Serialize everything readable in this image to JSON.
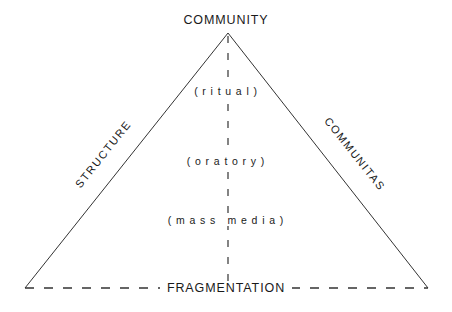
{
  "figure": {
    "type": "triangle-continuum-diagram",
    "background_color": "#ffffff",
    "line_color": "#333333"
  },
  "vertices": {
    "apex": "COMMUNITY",
    "base": "FRAGMENTATION"
  },
  "sides": {
    "left": "STRUCTURE",
    "right": "COMMUNITAS"
  },
  "axis": {
    "labels": [
      "( r i t u a l )",
      "( o r a t o r y )",
      "( m a s s   m e d i a )"
    ],
    "plain_labels": [
      "(ritual)",
      "(oratory)",
      "(mass media)"
    ]
  },
  "lines": {
    "apex_to_base_style": "dashed",
    "base_style": "dashed",
    "left_side_style": "solid",
    "right_side_style": "solid"
  }
}
